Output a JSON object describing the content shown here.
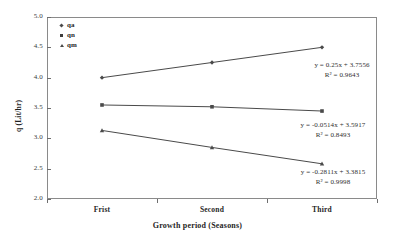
{
  "chart_data": {
    "type": "line",
    "title": "",
    "xlabel": "Growth period (Seasons)",
    "ylabel": "q (Lit/hr)",
    "categories": [
      "Frist",
      "Second",
      "Third"
    ],
    "ylim": [
      2.0,
      5.0
    ],
    "ytick_labels": [
      "5.0",
      "4.5",
      "4.0",
      "3.5",
      "3.0",
      "2.5",
      "2.0"
    ],
    "ytick_values": [
      5.0,
      4.5,
      4.0,
      3.5,
      3.0,
      2.5,
      2.0
    ],
    "grid": false,
    "legend_position": "top-left",
    "series": [
      {
        "name": "qa",
        "marker": "diamond",
        "values": [
          4.0,
          4.25,
          4.5
        ]
      },
      {
        "name": "qn",
        "marker": "square",
        "values": [
          3.55,
          3.52,
          3.45
        ]
      },
      {
        "name": "qm",
        "marker": "triangle",
        "values": [
          3.13,
          2.85,
          2.58
        ]
      }
    ],
    "annotations": [
      {
        "equation": "y = 0.25x + 3.7556",
        "r2": "R² = 0.9643",
        "series": "qa"
      },
      {
        "equation": "y = -0.0514x + 3.5917",
        "r2": "R² = 0.8493",
        "series": "qn"
      },
      {
        "equation": "y = -0.2811x + 3.3815",
        "r2": "R² = 0.9998",
        "series": "qm"
      }
    ]
  },
  "axes": {
    "y_title": "q (Lit/hr)",
    "x_title": "Growth period (Seasons)",
    "y_ticks": [
      "5.0",
      "4.5",
      "4.0",
      "3.5",
      "3.0",
      "2.5",
      "2.0"
    ],
    "x_ticks": [
      "Frist",
      "Second",
      "Third"
    ]
  },
  "legend": {
    "items": [
      {
        "label": "qa",
        "icon": "diamond-marker-icon"
      },
      {
        "label": "qn",
        "icon": "square-marker-icon"
      },
      {
        "label": "qm",
        "icon": "triangle-marker-icon"
      }
    ]
  },
  "annotations": {
    "qa": {
      "equation": "y = 0.25x + 3.7556",
      "r2": "R² = 0.9643"
    },
    "qn": {
      "equation": "y = -0.0514x + 3.5917",
      "r2": "R² = 0.8493"
    },
    "qm": {
      "equation": "y = -0.2811x + 3.3815",
      "r2": "R² = 0.9998"
    }
  },
  "colors": {
    "line": "#4a4a4a",
    "frame": "#8a8a8a",
    "text": "#1f1f1f"
  }
}
